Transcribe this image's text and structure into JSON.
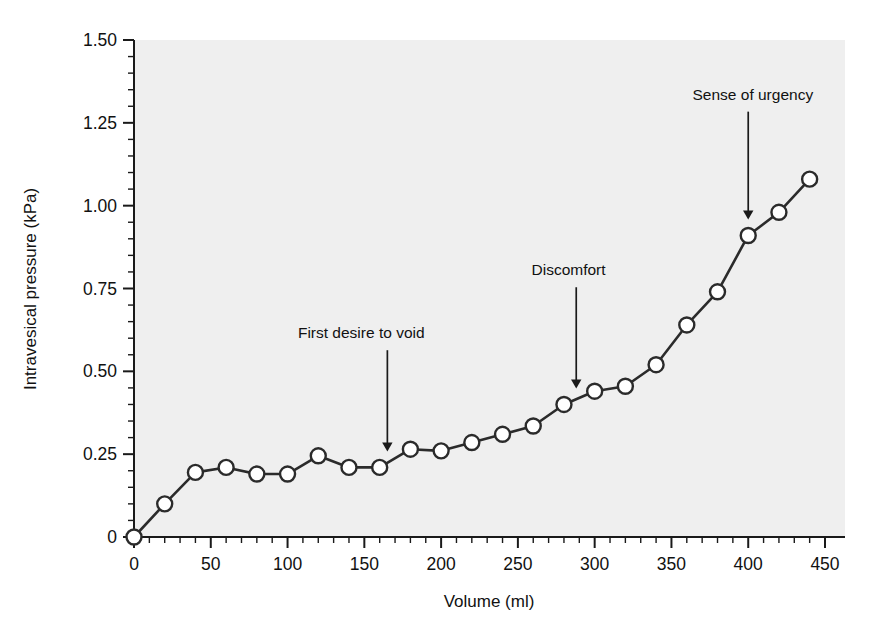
{
  "figure": {
    "plot_background_color": "#efefef",
    "page_background_color": "#ffffff",
    "line_color": "#2b2b2b",
    "marker_fill_color": "#ffffff",
    "marker_edge_color": "#2b2b2b",
    "axis_color": "#1a1a1a"
  },
  "chart_data": {
    "type": "line",
    "title": "",
    "xlabel": "Volume (ml)",
    "ylabel": "Intravesical pressure (kPa)",
    "xlim": [
      0,
      450
    ],
    "ylim": [
      0,
      1.5
    ],
    "grid": false,
    "legend": "none",
    "x_ticks": [
      0,
      50,
      100,
      150,
      200,
      250,
      300,
      350,
      400,
      450
    ],
    "x_tick_labels": [
      "0",
      "50",
      "100",
      "150",
      "200",
      "250",
      "300",
      "350",
      "400",
      "450"
    ],
    "x_minor_tick_interval": 10,
    "y_ticks": [
      0,
      0.25,
      0.5,
      0.75,
      1.0,
      1.25,
      1.5
    ],
    "y_tick_labels": [
      "0",
      "0.25",
      "0.50",
      "0.75",
      "1.00",
      "1.25",
      "1.50"
    ],
    "y_minor_tick_interval": 0.05,
    "series": [
      {
        "name": "Intravesical pressure",
        "marker": "circle-open",
        "x": [
          0,
          20,
          40,
          60,
          80,
          100,
          120,
          140,
          160,
          180,
          200,
          220,
          240,
          260,
          280,
          300,
          320,
          340,
          360,
          380,
          400,
          420,
          440
        ],
        "y": [
          0.0,
          0.1,
          0.195,
          0.21,
          0.19,
          0.19,
          0.245,
          0.21,
          0.21,
          0.265,
          0.26,
          0.285,
          0.31,
          0.335,
          0.4,
          0.44,
          0.455,
          0.52,
          0.64,
          0.74,
          0.91,
          0.98,
          1.08
        ]
      }
    ],
    "annotations": [
      {
        "label": "First desire to void",
        "x": 165,
        "y": 0.21,
        "text_x": 148,
        "text_y": 0.6,
        "arrow": "down"
      },
      {
        "label": "Discomfort",
        "x": 288,
        "y": 0.4,
        "text_x": 283,
        "text_y": 0.79,
        "arrow": "down"
      },
      {
        "label": "Sense of urgency",
        "x": 400,
        "y": 0.91,
        "text_x": 403,
        "text_y": 1.32,
        "arrow": "down"
      }
    ]
  }
}
